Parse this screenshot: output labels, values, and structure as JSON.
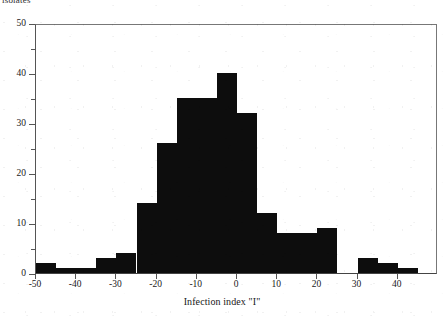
{
  "figure": {
    "top_caption": "isolates",
    "background_color": "#ffffff",
    "bar_color": "#0d0d0d",
    "axis_color": "#555555"
  },
  "chart_data": {
    "type": "bar",
    "title": "",
    "subtitle": "",
    "xlabel": "Infection index \"I\"",
    "ylabel": "",
    "xlim": [
      -50,
      50
    ],
    "ylim": [
      0,
      50
    ],
    "grid": false,
    "legend": null,
    "bin_width": 5,
    "bin_starts": [
      -50,
      -45,
      -40,
      -35,
      -30,
      -25,
      -20,
      -15,
      -10,
      -5,
      0,
      5,
      10,
      15,
      20,
      25,
      30,
      35,
      40,
      45
    ],
    "categories": [
      "-50",
      "-45",
      "-40",
      "-35",
      "-30",
      "-25",
      "-20",
      "-15",
      "-10",
      "-5",
      "0",
      "5",
      "10",
      "15",
      "20",
      "25",
      "30",
      "35",
      "40",
      "45"
    ],
    "values": [
      2,
      1,
      1,
      3,
      4,
      14,
      26,
      35,
      35,
      40,
      32,
      12,
      8,
      8,
      9,
      0,
      3,
      2,
      1,
      0
    ],
    "x_ticks": [
      -50,
      -40,
      -30,
      -20,
      -10,
      0,
      10,
      20,
      30,
      40
    ],
    "x_tick_labels": [
      "-50",
      "-40",
      "-30",
      "-20",
      "-10",
      "0",
      "10",
      "20",
      "30",
      "40"
    ],
    "y_ticks": [
      0,
      10,
      20,
      30,
      40,
      50
    ],
    "y_tick_labels": [
      "0",
      "10",
      "20",
      "30",
      "40",
      "50"
    ],
    "y_minor_ticks": [
      5,
      15,
      25,
      35,
      45
    ]
  }
}
